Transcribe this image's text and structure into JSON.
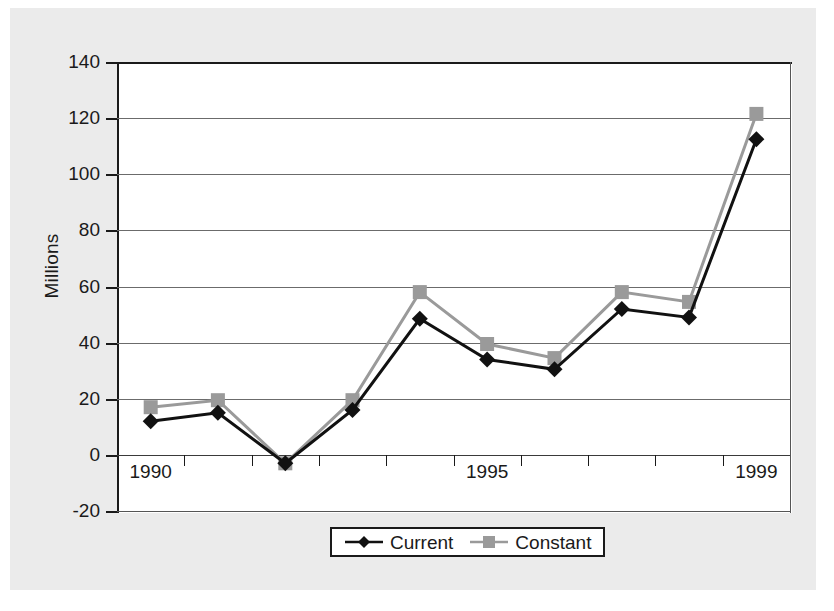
{
  "chart_data": {
    "type": "line",
    "title": "",
    "xlabel": "",
    "ylabel": "Millions",
    "x": [
      1990,
      1991,
      1992,
      1993,
      1994,
      1995,
      1996,
      1997,
      1998,
      1999
    ],
    "xtick_labels": [
      "1990",
      "",
      "",
      "",
      "",
      "1995",
      "",
      "",
      "",
      "1999"
    ],
    "ytick_labels": [
      "140",
      "120",
      "100",
      "80",
      "60",
      "40",
      "20",
      "0",
      "-20"
    ],
    "ytick_values": [
      140,
      120,
      100,
      80,
      60,
      40,
      20,
      0,
      -20
    ],
    "ylim": [
      -20,
      140
    ],
    "grid": true,
    "legend_position": "bottom-center",
    "series": [
      {
        "name": "Current",
        "color": "#111111",
        "marker": "diamond",
        "values": [
          12,
          15,
          -3,
          16,
          48.5,
          34,
          30.5,
          52,
          49,
          112.5
        ]
      },
      {
        "name": "Constant",
        "color": "#9a9a9a",
        "marker": "square",
        "values": [
          17,
          19.5,
          -3,
          19.5,
          58,
          39.5,
          34.5,
          58,
          54.5,
          121.5
        ]
      }
    ]
  },
  "legend": {
    "entries": [
      {
        "label": "Current"
      },
      {
        "label": "Constant"
      }
    ]
  },
  "axis": {
    "y_title": "Millions"
  },
  "colors": {
    "current": "#111111",
    "constant": "#9a9a9a",
    "panel": "#ebebeb",
    "plot_background": "#ffffff",
    "axis": "#1a1a1a",
    "gridline": "#6b6b6b"
  }
}
